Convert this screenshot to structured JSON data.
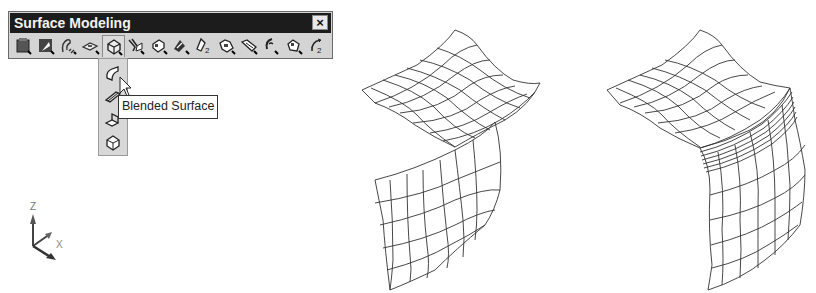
{
  "toolbar": {
    "title": "Surface Modeling",
    "close_label": "×",
    "icons": [
      {
        "name": "region-icon"
      },
      {
        "name": "extrude-surface-icon"
      },
      {
        "name": "revolve-surface-icon"
      },
      {
        "name": "plane-surface-icon"
      },
      {
        "name": "blend-surface-flyout-icon",
        "active": true
      },
      {
        "name": "sweep-surface-icon"
      },
      {
        "name": "loft-surface-icon"
      },
      {
        "name": "offset-surface-icon"
      },
      {
        "name": "fillet-surface-icon"
      },
      {
        "name": "trim-surface-icon"
      },
      {
        "name": "extend-surface-icon"
      },
      {
        "name": "curve-on-surface-icon"
      },
      {
        "name": "patch-surface-icon"
      },
      {
        "name": "network-surface-icon"
      }
    ]
  },
  "flyout": {
    "items": [
      {
        "name": "blended-surface-icon",
        "label": "Blended Surface"
      },
      {
        "name": "tube-surface-icon"
      },
      {
        "name": "corner-surface-icon"
      },
      {
        "name": "patch-corner-icon"
      }
    ]
  },
  "tooltip": {
    "text": "Blended Surface"
  },
  "ucs": {
    "z_label": "Z",
    "x_label": "X",
    "y_label": "Y"
  },
  "viewport": {
    "left_figure": "Two separate mesh surfaces (before blend)",
    "right_figure": "Two surfaces joined by blended surface (after blend)"
  }
}
